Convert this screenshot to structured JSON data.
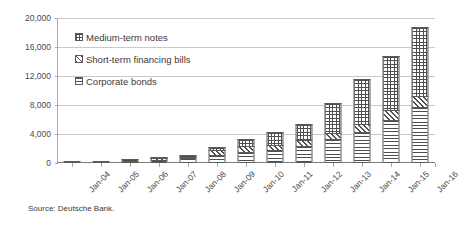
{
  "chart_data": {
    "type": "bar",
    "stacked": true,
    "title": "",
    "subtitle": "",
    "xlabel": "",
    "ylabel": "",
    "ylim": [
      0,
      20000
    ],
    "ytick_values": [
      0,
      4000,
      8000,
      12000,
      16000,
      20000
    ],
    "ytick_labels": [
      "0",
      "4,000",
      "8,000",
      "12,000",
      "16,000",
      "20,000"
    ],
    "grid": true,
    "legend_position": "upper-left-inside",
    "categories": [
      "Jan-04",
      "Jan-05",
      "Jan-06",
      "Jan-07",
      "Jan-08",
      "Jan-09",
      "Jan-10",
      "Jan-11",
      "Jan-12",
      "Jan-13",
      "Jan-14",
      "Jan-15",
      "Jan-16"
    ],
    "series": [
      {
        "name": "Corporate bonds",
        "pattern": "horizontal-lines",
        "values": [
          120,
          220,
          330,
          480,
          640,
          1100,
          1500,
          1750,
          2400,
          3300,
          4300,
          5900,
          7700
        ]
      },
      {
        "name": "Short-term financing bills",
        "pattern": "diagonal-hatch",
        "values": [
          0,
          0,
          0,
          120,
          220,
          700,
          800,
          750,
          800,
          900,
          1100,
          1400,
          1500
        ]
      },
      {
        "name": "Medium-term notes",
        "pattern": "crosshatch-grid",
        "values": [
          0,
          0,
          80,
          140,
          250,
          450,
          1050,
          1800,
          2200,
          4100,
          6200,
          7500,
          9600
        ]
      }
    ],
    "totals": [
      120,
      220,
      410,
      740,
      1110,
      2250,
      3350,
      4300,
      5400,
      8300,
      11600,
      14800,
      18800
    ]
  },
  "legend": {
    "items": [
      {
        "label": "Medium-term notes",
        "pattern": "crosshatch-grid"
      },
      {
        "label": "Short-term financing bills",
        "pattern": "diagonal-hatch"
      },
      {
        "label": "Corporate bonds",
        "pattern": "horizontal-lines"
      }
    ]
  },
  "source": {
    "text": "Source: Deutsche Bank."
  },
  "colors": {
    "background": "#ffffff",
    "gridline": "#c9c9c9",
    "axis": "#a9a9a9",
    "bar_outline": "#5a5a5a",
    "pattern_ink": "#4f4f4f",
    "text": "#3a3a3a"
  }
}
